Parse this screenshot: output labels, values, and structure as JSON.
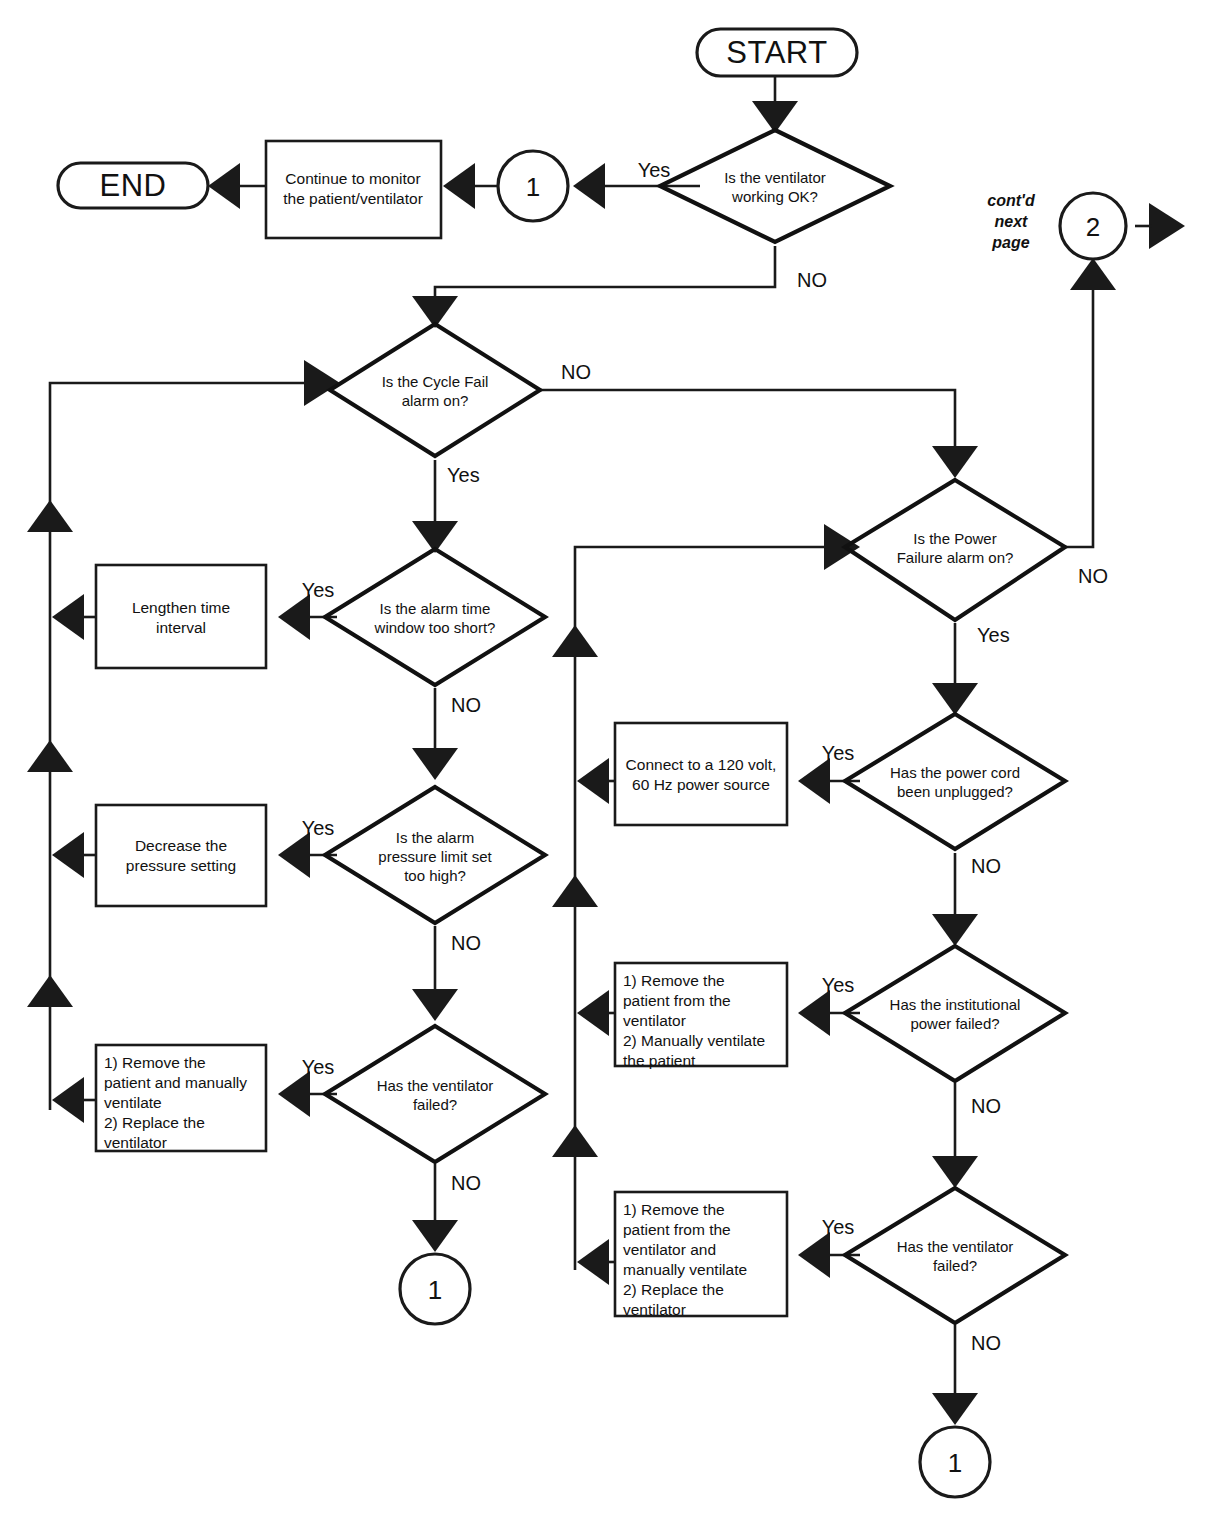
{
  "diagram": {
    "colors": {
      "line": "#1a1a1a",
      "text": "#111111",
      "background": "#ffffff"
    }
  },
  "terminators": {
    "start": "START",
    "end": "END"
  },
  "connectors": {
    "c1_top": "1",
    "c2": "2",
    "c1_bottom_left": "1",
    "c1_bottom_right": "1",
    "contd_note": "cont'd\nnext\npage",
    "contd_line1": "cont'd",
    "contd_line2": "next",
    "contd_line3": "page"
  },
  "decisions": [
    {
      "id": "vent-ok",
      "line1": "Is the ventilator",
      "line2": "working OK?",
      "yes": "Yes",
      "no": "NO"
    },
    {
      "id": "cycle-fail",
      "line1": "Is the Cycle Fail",
      "line2": "alarm on?",
      "yes": "Yes",
      "no": "NO"
    },
    {
      "id": "power-failure",
      "line1": "Is the Power",
      "line2": "Failure alarm on?",
      "yes": "Yes",
      "no": "NO"
    },
    {
      "id": "alarm-time-window",
      "line1": "Is the alarm time",
      "line2": "window too short?",
      "yes": "Yes",
      "no": "NO"
    },
    {
      "id": "alarm-pressure-limit",
      "line1": "Is the alarm",
      "line2": "pressure limit set",
      "line3": "too high?",
      "yes": "Yes",
      "no": "NO"
    },
    {
      "id": "ventilator-failed-left",
      "line1": "Has the ventilator",
      "line2": "failed?",
      "yes": "Yes",
      "no": "NO"
    },
    {
      "id": "power-cord",
      "line1": "Has the power cord",
      "line2": "been unplugged?",
      "yes": "Yes",
      "no": "NO"
    },
    {
      "id": "institutional-power",
      "line1": "Has the institutional",
      "line2": "power failed?",
      "yes": "Yes",
      "no": "NO"
    },
    {
      "id": "ventilator-failed-right",
      "line1": "Has the ventilator",
      "line2": "failed?",
      "yes": "Yes",
      "no": "NO"
    }
  ],
  "processes": [
    {
      "id": "continue-monitor",
      "lines": [
        "Continue to monitor",
        "the patient/ventilator"
      ]
    },
    {
      "id": "lengthen-time-interval",
      "lines": [
        "Lengthen time",
        "interval"
      ]
    },
    {
      "id": "decrease-pressure-setting",
      "lines": [
        "Decrease the",
        "pressure setting"
      ]
    },
    {
      "id": "remove-replace-ventilator-left",
      "lines": [
        "1) Remove the",
        "patient and manually",
        "ventilate",
        "2) Replace the",
        "ventilator"
      ]
    },
    {
      "id": "connect-power-source",
      "lines": [
        "Connect to a 120 volt,",
        "60 Hz power source"
      ]
    },
    {
      "id": "remove-manually-ventilate",
      "lines": [
        "1) Remove the",
        "patient from the",
        "ventilator",
        "2) Manually ventilate",
        "the patient"
      ]
    },
    {
      "id": "remove-replace-ventilator-right",
      "lines": [
        "1) Remove the",
        "patient from the",
        "ventilator and",
        "manually ventilate",
        "2) Replace the",
        "ventilator"
      ]
    }
  ],
  "edge_labels": {
    "vent_ok_yes": "Yes",
    "vent_ok_no": "NO",
    "cycle_fail_no": "NO",
    "cycle_fail_yes": "Yes",
    "power_failure_no": "NO",
    "power_failure_yes": "Yes",
    "alarm_time_yes": "Yes",
    "alarm_time_no": "NO",
    "alarm_pressure_yes": "Yes",
    "alarm_pressure_no": "NO",
    "vent_failed_left_yes": "Yes",
    "vent_failed_left_no": "NO",
    "power_cord_yes": "Yes",
    "power_cord_no": "NO",
    "institutional_yes": "Yes",
    "institutional_no": "NO",
    "vent_failed_right_yes": "Yes",
    "vent_failed_right_no": "NO"
  }
}
